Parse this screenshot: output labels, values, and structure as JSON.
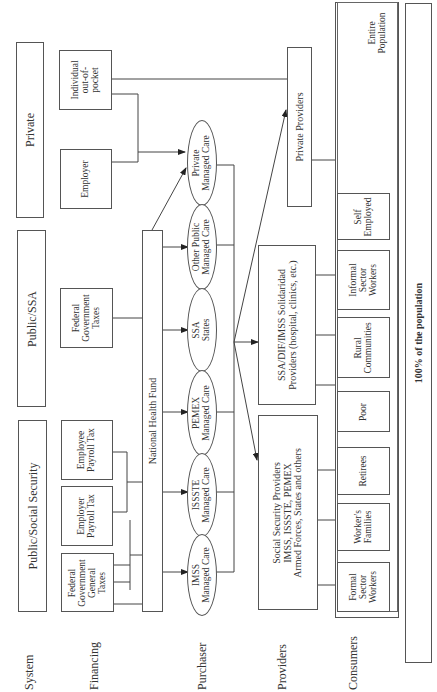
{
  "row_labels": {
    "system": "System",
    "financing": "Financing",
    "purchaser": "Purchaser",
    "providers": "Providers",
    "consumers": "Consumers"
  },
  "system": {
    "private": "Private",
    "public_ssa": "Public/SSA",
    "public_social_security": "Public/Social Security"
  },
  "financing": {
    "individual_out_of_pocket": "Individual\nout-of-\npocket",
    "employer": "Employer",
    "federal_government_taxes": "Federal\nGovernment\nTaxes",
    "employee_payroll_tax": "Employee\nPayroll Tax",
    "employer_payroll_tax": "Employer\nPayroll Tax",
    "federal_government_general_taxes": "Federal\nGovernment\nGeneral\nTaxes"
  },
  "national_health_fund": "National Health Fund",
  "purchasers": {
    "private_managed_care": "Private\nManaged Care",
    "other_public_managed_care": "Other Public\nManaged Care",
    "ssa_states": "SSA\nStates",
    "pemex_managed_care": "PEMEX\nManaged Care",
    "issste_managed_care": "ISSSTE\nManaged Care",
    "imss_managed_care": "IMSS\nManaged Care"
  },
  "providers": {
    "private_providers": "Private Providers",
    "ssa_dif_imss": "SSA/DIF/IMSS Solidaridad\nProviders (hospital, clinics, etc.)",
    "social_security_providers": "Social Security Providers\nIMSS, ISSSTE, PEMEX\nArmed Forces, States and others"
  },
  "consumers": {
    "entire_population": "Entire\nPopulation",
    "self_employed": "Self\nEmployed",
    "informal_sector_workers": "Informal\nSector\nWorkers",
    "rural_communities": "Rural\nCommunities",
    "poor": "Poor",
    "retirees": "Retirees",
    "workers_families": "Worker's\nFamilies",
    "formal_sector_workers": "Formal\nSector\nWorkers"
  },
  "population_bar": "100% of the population"
}
